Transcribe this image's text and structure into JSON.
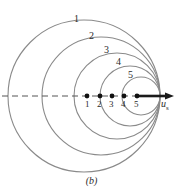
{
  "figure": {
    "caption": "(b)",
    "axis_label_main": "u",
    "axis_label_sub": "s",
    "colors": {
      "wavefront": "#8a8a8a",
      "axis_dash": "#555555",
      "arrow": "#1a1a1a",
      "dot": "#111111",
      "text": "#2b2b2b",
      "background": "#ffffff"
    }
  },
  "wavefronts": [
    {
      "label": "1",
      "cx": 84,
      "cy": 96,
      "r": 76,
      "label_x": 74,
      "label_y": 14
    },
    {
      "label": "2",
      "cx": 101,
      "cy": 96,
      "r": 59,
      "label_x": 89,
      "label_y": 31
    },
    {
      "label": "3",
      "cx": 117,
      "cy": 96,
      "r": 43,
      "label_x": 104,
      "label_y": 45
    },
    {
      "label": "4",
      "cx": 130,
      "cy": 96,
      "r": 30,
      "label_x": 116,
      "label_y": 57
    },
    {
      "label": "5",
      "cx": 141,
      "cy": 96,
      "r": 19,
      "label_x": 128,
      "label_y": 70
    }
  ],
  "source_positions": [
    {
      "label": "1",
      "x": 87,
      "y": 96,
      "label_x": 85,
      "label_y": 100
    },
    {
      "label": "2",
      "x": 100,
      "y": 96,
      "label_x": 97,
      "label_y": 100
    },
    {
      "label": "3",
      "x": 112,
      "y": 96,
      "label_x": 109,
      "label_y": 100
    },
    {
      "label": "4",
      "x": 124,
      "y": 96,
      "label_x": 121,
      "label_y": 100
    },
    {
      "label": "5",
      "x": 137,
      "y": 96,
      "label_x": 134,
      "label_y": 100
    }
  ],
  "axis": {
    "dash_x1": 2,
    "dash_x2": 137,
    "y": 96,
    "arrow_x1": 137,
    "arrow_x2": 174,
    "label_x": 161,
    "label_y": 99
  }
}
